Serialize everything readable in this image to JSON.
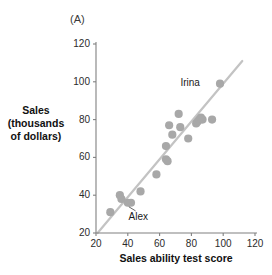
{
  "figure": {
    "panel_letter": "(A)",
    "y_axis_title_lines": [
      "Sales",
      "(thousands",
      "of dollars)"
    ],
    "x_axis_title": "Sales ability test score"
  },
  "colors": {
    "point": "#a8a8a8",
    "line": "#c3c3c3",
    "axis": "#808080",
    "text": "#1a1a1a"
  },
  "chart_data": {
    "type": "scatter",
    "title": "(A)",
    "xlabel": "Sales ability test score",
    "ylabel": "Sales (thousands of dollars)",
    "xlim": [
      20,
      120
    ],
    "ylim": [
      20,
      120
    ],
    "xticks": [
      20,
      40,
      60,
      80,
      100,
      120
    ],
    "yticks": [
      20,
      40,
      60,
      80,
      100,
      120
    ],
    "grid": false,
    "legend": "none",
    "points": [
      {
        "x": 29,
        "y": 31
      },
      {
        "x": 35,
        "y": 40
      },
      {
        "x": 36,
        "y": 38
      },
      {
        "x": 40,
        "y": 36
      },
      {
        "x": 42,
        "y": 36,
        "label": "Alex"
      },
      {
        "x": 48,
        "y": 42
      },
      {
        "x": 58,
        "y": 51
      },
      {
        "x": 64,
        "y": 59
      },
      {
        "x": 65,
        "y": 58
      },
      {
        "x": 64,
        "y": 66
      },
      {
        "x": 66,
        "y": 77
      },
      {
        "x": 68,
        "y": 72
      },
      {
        "x": 72,
        "y": 83
      },
      {
        "x": 73,
        "y": 76
      },
      {
        "x": 78,
        "y": 70
      },
      {
        "x": 83,
        "y": 78
      },
      {
        "x": 84,
        "y": 79
      },
      {
        "x": 85,
        "y": 80
      },
      {
        "x": 86,
        "y": 81
      },
      {
        "x": 87,
        "y": 80
      },
      {
        "x": 93,
        "y": 80
      },
      {
        "x": 98,
        "y": 99,
        "label": "Irina"
      }
    ],
    "trend_line": {
      "x1": 21,
      "y1": 20,
      "x2": 112,
      "y2": 111
    },
    "annotations": [
      {
        "text": "Irina",
        "x": 92,
        "y": 99,
        "anchor": "right"
      },
      {
        "text": "Alex",
        "x": 43,
        "y": 28,
        "anchor": "left",
        "leader_to": {
          "x": 40,
          "y": 36
        }
      }
    ]
  }
}
